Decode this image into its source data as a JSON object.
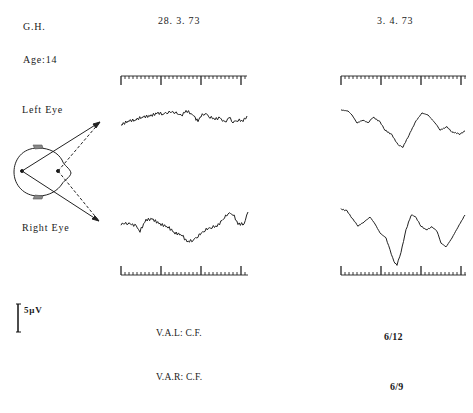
{
  "header": {
    "subject": "G.H.",
    "age": "Age:14",
    "dates": [
      "28. 3. 73",
      "3. 4. 73"
    ]
  },
  "labels": {
    "left_eye": "Left  Eye",
    "right_eye": "Right  Eye"
  },
  "scale": {
    "amplitude_label": "5µV"
  },
  "acuity": {
    "val_label": "V.A.L:  C.F.",
    "var_label": "V.A.R:  C.F.",
    "val_value": "6/12",
    "var_value": "6/9"
  },
  "chart_data": {
    "type": "line",
    "xlabel": "time (scale bar ticks)",
    "ylabel": "amplitude (5µV scale bar)",
    "series": [
      {
        "name": "Left Eye 28.3.73",
        "points": [
          [
            121,
            125
          ],
          [
            128,
            121
          ],
          [
            135,
            120
          ],
          [
            142,
            117
          ],
          [
            150,
            116
          ],
          [
            158,
            113
          ],
          [
            163,
            114
          ],
          [
            168,
            112
          ],
          [
            175,
            112
          ],
          [
            181,
            116
          ],
          [
            186,
            111
          ],
          [
            191,
            113
          ],
          [
            195,
            118
          ],
          [
            198,
            121
          ],
          [
            201,
            116
          ],
          [
            205,
            113
          ],
          [
            210,
            117
          ],
          [
            215,
            119
          ],
          [
            220,
            118
          ],
          [
            225,
            123
          ],
          [
            229,
            117
          ],
          [
            233,
            122
          ],
          [
            238,
            120
          ],
          [
            243,
            121
          ],
          [
            247,
            116
          ]
        ]
      },
      {
        "name": "Right Eye 28.3.73",
        "points": [
          [
            121,
            224
          ],
          [
            128,
            223
          ],
          [
            136,
            226
          ],
          [
            140,
            231
          ],
          [
            146,
            220
          ],
          [
            152,
            219
          ],
          [
            160,
            224
          ],
          [
            168,
            227
          ],
          [
            175,
            233
          ],
          [
            182,
            235
          ],
          [
            187,
            242
          ],
          [
            193,
            240
          ],
          [
            198,
            236
          ],
          [
            205,
            230
          ],
          [
            212,
            227
          ],
          [
            217,
            226
          ],
          [
            222,
            221
          ],
          [
            228,
            213
          ],
          [
            233,
            214
          ],
          [
            238,
            224
          ],
          [
            244,
            224
          ],
          [
            248,
            212
          ]
        ]
      },
      {
        "name": "Left Eye 3.4.73",
        "points": [
          [
            341,
            110
          ],
          [
            348,
            111
          ],
          [
            352,
            115
          ],
          [
            357,
            123
          ],
          [
            363,
            120
          ],
          [
            368,
            123
          ],
          [
            373,
            117
          ],
          [
            380,
            122
          ],
          [
            385,
            130
          ],
          [
            392,
            135
          ],
          [
            398,
            145
          ],
          [
            403,
            147
          ],
          [
            409,
            135
          ],
          [
            416,
            121
          ],
          [
            422,
            113
          ],
          [
            428,
            115
          ],
          [
            436,
            124
          ],
          [
            440,
            130
          ],
          [
            447,
            127
          ],
          [
            452,
            132
          ],
          [
            460,
            134
          ],
          [
            465,
            131
          ]
        ]
      },
      {
        "name": "Right Eye 3.4.73",
        "points": [
          [
            341,
            209
          ],
          [
            347,
            211
          ],
          [
            352,
            218
          ],
          [
            358,
            226
          ],
          [
            364,
            222
          ],
          [
            370,
            217
          ],
          [
            375,
            224
          ],
          [
            380,
            233
          ],
          [
            386,
            238
          ],
          [
            390,
            250
          ],
          [
            394,
            262
          ],
          [
            397,
            265
          ],
          [
            401,
            252
          ],
          [
            406,
            230
          ],
          [
            411,
            215
          ],
          [
            415,
            216
          ],
          [
            421,
            226
          ],
          [
            426,
            230
          ],
          [
            432,
            227
          ],
          [
            437,
            231
          ],
          [
            441,
            243
          ],
          [
            446,
            247
          ],
          [
            452,
            238
          ],
          [
            458,
            227
          ],
          [
            465,
            215
          ]
        ]
      }
    ],
    "time_bars": [
      {
        "x0": 121,
        "x1": 247,
        "y": 76,
        "orientation": "top"
      },
      {
        "x0": 341,
        "x1": 466,
        "y": 76,
        "orientation": "top"
      },
      {
        "x0": 121,
        "x1": 248,
        "y": 275,
        "orientation": "bottom"
      },
      {
        "x0": 341,
        "x1": 466,
        "y": 275,
        "orientation": "bottom"
      }
    ],
    "grid": false,
    "legend": "none"
  }
}
